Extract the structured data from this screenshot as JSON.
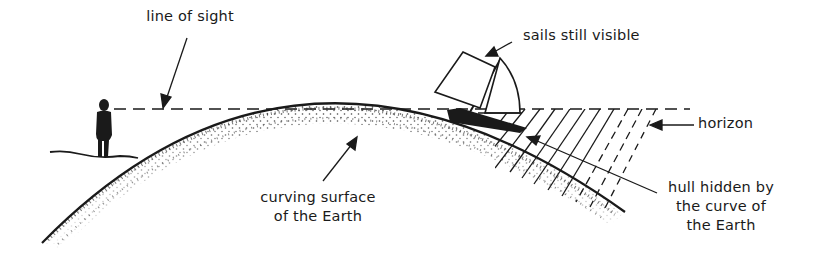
{
  "diagram": {
    "colors": {
      "ink": "#1a1a1a",
      "background": "#ffffff"
    },
    "labels": {
      "line_of_sight": "line of sight",
      "sails_visible": "sails still visible",
      "horizon": "horizon",
      "hull_hidden": [
        "hull hidden by",
        "the curve of",
        "the Earth"
      ],
      "curving_surface": [
        "curving surface",
        "of the Earth"
      ]
    },
    "elements": {
      "observer": "person-silhouette",
      "ship": "sailing-ship",
      "earth": "curved-stippled-surface",
      "sight_line": "dashed-line",
      "hidden_zone": "diagonal-hatching"
    }
  }
}
